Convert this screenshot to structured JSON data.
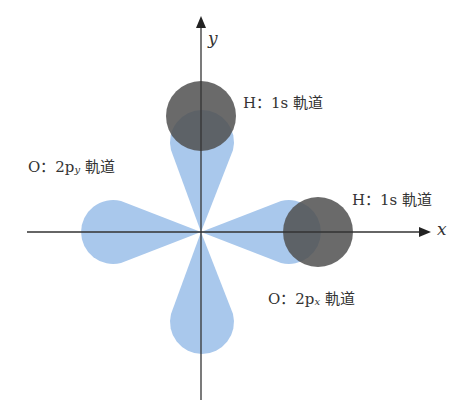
{
  "diagram": {
    "title": "",
    "axes": {
      "x_label": "x",
      "y_label": "y"
    },
    "labels": {
      "h_top": {
        "prefix": "H：1s",
        "suffix": "軌道"
      },
      "h_right": {
        "prefix": "H：1s",
        "suffix": "軌道"
      },
      "o_py": {
        "prefix": "O：2p",
        "sub": "y",
        "suffix": "軌道"
      },
      "o_px": {
        "prefix": "O：2p",
        "sub": "x",
        "suffix": "軌道"
      }
    },
    "colors": {
      "p_orbital": "#a9c8ec",
      "s_orbital": "#5f5f5f",
      "axis": "#333333"
    }
  }
}
